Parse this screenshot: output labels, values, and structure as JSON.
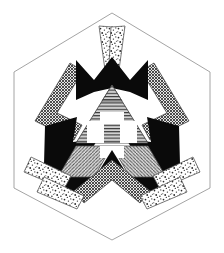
{
  "artwork": {
    "title": "Hexagonal Radial Emblem",
    "kind": "geometric-line-art",
    "symmetry": "3-fold rotational with bilateral mirror",
    "background_color": "#ffffff",
    "ink_color": "#000000",
    "outline_color": "#9a9a9a",
    "canvas": {
      "width": 224,
      "height": 253
    }
  },
  "frame": {
    "name": "hexagon-border",
    "stroke_color": "#9a9a9a",
    "stroke_width": 0.9,
    "fill": "none",
    "points": "112,13 210,72 210,188 112,240 14,188 14,72",
    "vertices": [
      {
        "label": "top",
        "x": 112,
        "y": 13
      },
      {
        "label": "upper-right",
        "x": 210,
        "y": 72
      },
      {
        "label": "lower-right",
        "x": 210,
        "y": 188
      },
      {
        "label": "bottom",
        "x": 112,
        "y": 240
      },
      {
        "label": "lower-left",
        "x": 14,
        "y": 188
      },
      {
        "label": "upper-left",
        "x": 14,
        "y": 72
      }
    ]
  },
  "palette": {
    "solid_black": "#0a0a0a",
    "stipple_ink": "#2b2b2b",
    "stipple_field": "#ffffff",
    "crosshatch_ink": "#3a3a3a",
    "crosshatch_field": "#e8e8e8",
    "hline_ink": "#353535",
    "hline_field": "#cfcfcf",
    "diag_ink": "#4a4a4a",
    "diag_field": "#d8d8d8",
    "outline": "#6a6a6a"
  },
  "textures": [
    {
      "id": "stipple",
      "name": "stipple-dots",
      "description": "random coarse dots on white",
      "ink": "#2b2b2b",
      "field": "#ffffff"
    },
    {
      "id": "crosshatch",
      "name": "dense-crosshatch",
      "description": "fine crossed diagonal lines, dark gray",
      "ink": "#3a3a3a",
      "field": "#e8e8e8"
    },
    {
      "id": "hlines",
      "name": "horizontal-rule-lines",
      "description": "evenly spaced horizontal lines",
      "ink": "#353535",
      "field": "#cfcfcf"
    },
    {
      "id": "diaglines",
      "name": "diagonal-hatch",
      "description": "parallel diagonal hatch lines",
      "ink": "#4a4a4a",
      "field": "#d8d8d8"
    },
    {
      "id": "solid",
      "name": "solid-black",
      "description": "flat black fill",
      "ink": "#0a0a0a",
      "field": "#0a0a0a"
    }
  ],
  "elements": {
    "spokes_stipple": [
      {
        "name": "stipple-spoke-top-left",
        "texture": "stipple",
        "points": "100,25 114,26 116,66 104,70"
      },
      {
        "name": "stipple-spoke-top-right",
        "texture": "stipple",
        "points": "124,25 110,26 108,66 120,70"
      },
      {
        "name": "stipple-spoke-lower-left-outer",
        "texture": "stipple",
        "points": "26,170 33,158 70,176 64,188"
      },
      {
        "name": "stipple-spoke-lower-left-inner",
        "texture": "stipple",
        "points": "38,190 45,178 82,196 76,208"
      },
      {
        "name": "stipple-spoke-lower-right-outer",
        "texture": "stipple",
        "points": "198,170 191,158 154,176 160,188"
      },
      {
        "name": "stipple-spoke-lower-right-inner",
        "texture": "stipple",
        "points": "186,190 179,178 142,196 148,208"
      }
    ],
    "spokes_crosshatch": [
      {
        "name": "crosshatch-arm-upper-left",
        "texture": "crosshatch",
        "points": "68,64 81,72 56,115 80,126 73,139 36,120"
      },
      {
        "name": "crosshatch-arm-upper-right",
        "texture": "crosshatch",
        "points": "156,64 143,72 168,115 144,126 151,139 188,120"
      },
      {
        "name": "crosshatch-arm-bottom",
        "texture": "crosshatch",
        "points": "112,161 148,190 139,201 112,178 85,201 76,190"
      }
    ],
    "black_wedges": [
      {
        "name": "black-wedge-top",
        "texture": "solid",
        "points": "78,60 95,78 112,58 129,78 146,60 146,104 112,90 78,104"
      },
      {
        "name": "black-wedge-lower-left",
        "texture": "solid",
        "points": "48,124 76,118 72,142 96,140 78,170 96,182 62,196 46,162"
      },
      {
        "name": "black-wedge-lower-right",
        "texture": "solid",
        "points": "176,124 148,118 152,142 128,140 146,170 128,182 162,196 178,162"
      }
    ],
    "center": {
      "name": "sierpinski-core",
      "parts": [
        {
          "name": "core-triangle-top",
          "texture": "hlines",
          "points": "112,86 146,142 78,142"
        },
        {
          "name": "core-triangle-left",
          "texture": "diaglines",
          "points": "78,146 112,146 95,176 61,176"
        },
        {
          "name": "core-triangle-right",
          "texture": "diaglines",
          "points": "146,146 112,146 129,176 163,176"
        },
        {
          "name": "core-triangle-bottom-notch",
          "texture": "solid",
          "points": "112,148 126,172 98,172"
        },
        {
          "name": "core-cut-left",
          "texture": "field",
          "points": "88,124 104,124 104,142 88,142"
        },
        {
          "name": "core-cut-right",
          "texture": "field",
          "points": "120,124 136,124 136,142 120,142"
        }
      ]
    }
  }
}
